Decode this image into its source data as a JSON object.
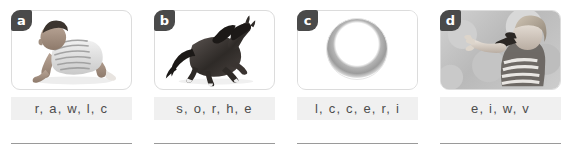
{
  "worksheet": {
    "title": "Unscramble the letters worksheet",
    "panels": [
      {
        "badge": "a",
        "image_alt": "baby crawling",
        "letters": "r, a, w, l, c",
        "answer_placeholder": ""
      },
      {
        "badge": "b",
        "image_alt": "black horse",
        "letters": "s, o, r, h, e",
        "answer_placeholder": ""
      },
      {
        "badge": "c",
        "image_alt": "gray circle ring",
        "letters": "l, c, c, e, r, i",
        "answer_placeholder": ""
      },
      {
        "badge": "d",
        "image_alt": "child waving",
        "letters": "e, i, w, v",
        "answer_placeholder": ""
      }
    ]
  },
  "colors": {
    "badge_background": "#4a4a4a",
    "badge_text": "#ffffff",
    "card_border": "#dcdcdc",
    "letters_background": "#f0f0f0",
    "letters_text": "#4d4d4d",
    "answer_line": "#9a9a9a",
    "page_background": "#ffffff"
  }
}
